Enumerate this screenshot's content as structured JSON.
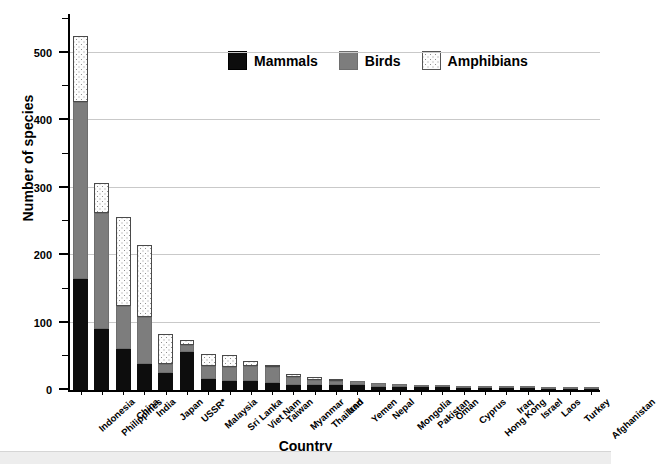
{
  "chart_data": {
    "type": "bar",
    "subtype": "stacked-vertical",
    "title": "",
    "xlabel": "Country",
    "ylabel": "Number of species",
    "ylim": [
      0,
      560
    ],
    "yticks": [
      0,
      100,
      200,
      300,
      400,
      500
    ],
    "ytick_labels": [
      "0",
      "100",
      "200",
      "300",
      "400",
      "500"
    ],
    "yminor_ticks": [
      50,
      150,
      250,
      350,
      450,
      550
    ],
    "grid": "horizontal-major",
    "legend_position": "top-center",
    "categories": [
      "Indonesia",
      "Philippines",
      "China",
      "India",
      "Japan",
      "USSR*",
      "Malaysia",
      "Sri Lanka",
      "Viet Nam",
      "Taiwan",
      "Myanmar",
      "Thailand",
      "Iran",
      "Yemen",
      "Nepal",
      "Mongolia",
      "Pakistan",
      "Oman",
      "Cyprus",
      "Hong Kong",
      "Iraq",
      "Israel",
      "Laos",
      "Turkey",
      "Afghanistan"
    ],
    "series": [
      {
        "name": "Mammals",
        "color": "#0d0d0d",
        "values": [
          165,
          91,
          61,
          38,
          25,
          57,
          16,
          13,
          13,
          11,
          8,
          7,
          7,
          7,
          5,
          5,
          5,
          4,
          3,
          3,
          3,
          3,
          2,
          2,
          2
        ]
      },
      {
        "name": "Birds",
        "color": "#7d7d7d",
        "values": [
          261,
          171,
          63,
          70,
          13,
          9,
          20,
          21,
          22,
          23,
          11,
          8,
          6,
          6,
          6,
          4,
          3,
          2,
          1,
          1,
          1,
          1,
          1,
          1,
          1
        ]
      },
      {
        "name": "Amphibians",
        "color": "#fdfdfd",
        "values": [
          98,
          44,
          132,
          107,
          45,
          8,
          18,
          18,
          8,
          3,
          5,
          5,
          3,
          0,
          0,
          0,
          0,
          0,
          0,
          0,
          0,
          0,
          0,
          0,
          0
        ]
      }
    ],
    "totals": [
      524,
      306,
      256,
      215,
      83,
      74,
      54,
      52,
      43,
      37,
      24,
      20,
      16,
      13,
      11,
      9,
      8,
      6,
      4,
      4,
      4,
      4,
      3,
      3,
      3
    ]
  },
  "legend": {
    "items": [
      {
        "label": "Mammals",
        "swatch": "mammals"
      },
      {
        "label": "Birds",
        "swatch": "birds"
      },
      {
        "label": "Amphibians",
        "swatch": "amph"
      }
    ]
  }
}
